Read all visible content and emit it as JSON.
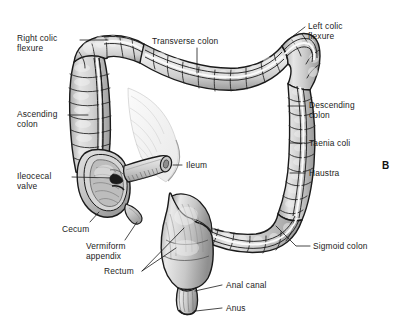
{
  "figure": {
    "panel_letter": "B",
    "background_color": "#ffffff",
    "ink_color": "#1b1b1b",
    "organ_fill_light": "#e8e8e8",
    "organ_fill_mid": "#c9c9c9",
    "organ_fill_dark": "#9a9a9a",
    "outline_color": "#1a1a1a"
  },
  "labels": {
    "right_colic_flexure": "Right colic\nflexure",
    "transverse_colon": "Transverse colon",
    "left_colic_flexure": "Left colic\nflexure",
    "ascending_colon": "Ascending\ncolon",
    "descending_colon": "Descending\ncolon",
    "taenia_coli": "Taenia coli",
    "ileocecal_valve": "Ileocecal\nvalve",
    "ileum": "Ileum",
    "haustra": "Haustra",
    "cecum": "Cecum",
    "vermiform_appendix": "Vermiform\nappendix",
    "sigmoid_colon": "Sigmoid colon",
    "rectum": "Rectum",
    "anal_canal": "Anal canal",
    "anus": "Anus"
  }
}
